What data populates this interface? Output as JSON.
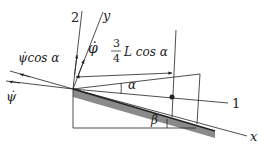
{
  "diagram": {
    "labels": {
      "axis_2": "2",
      "axis_y": "y",
      "axis_1": "1",
      "axis_x": "x",
      "phi_dot": "φ̇",
      "psi_dot_cos_alpha": "ψ̇cos α",
      "psi_dot": "ψ̇",
      "fraction_num": "3",
      "fraction_den": "4",
      "length_expr": "L cos α",
      "alpha": "α",
      "beta": "β"
    },
    "colors": {
      "line": "#222222",
      "shade": "#8a8a8a",
      "background": "#ffffff"
    }
  }
}
